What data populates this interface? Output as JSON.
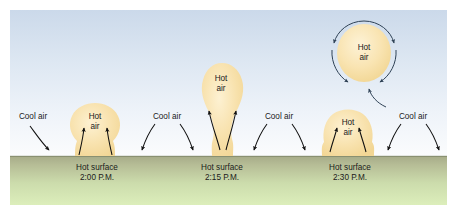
{
  "figure": {
    "colors": {
      "sky_top": "#cfdcec",
      "sky_bottom": "#fbfcfd",
      "ground_top": "#a8ad8c",
      "ground_bottom": "#d9e8b8",
      "plume_fill": "#f6dda2",
      "plume_fill_light": "#fbeec6",
      "arrow": "#101010",
      "circulation_arrow": "#3a4a5a",
      "text": "#1a1a1a",
      "page_background": "#ffffff"
    }
  },
  "labels": {
    "cool_air": "Cool air",
    "hot_word": "Hot",
    "air_word": "air",
    "hot_surface": "Hot surface"
  },
  "cool_air_labels": [
    {
      "id": "cool-air-1",
      "text": "Cool air",
      "x": 33,
      "y": 117
    },
    {
      "id": "cool-air-2",
      "text": "Cool air",
      "x": 167,
      "y": 117
    },
    {
      "id": "cool-air-3",
      "text": "Cool air",
      "x": 279,
      "y": 117
    },
    {
      "id": "cool-air-4",
      "text": "Cool air",
      "x": 413,
      "y": 117
    }
  ],
  "stages": [
    {
      "id": "stage-1",
      "time": "2:00 P.M.",
      "surface_label": "Hot surface",
      "hot_label_line1": "Hot",
      "hot_label_line2": "air",
      "caption_x": 97,
      "caption_y1": 168,
      "caption_y2": 178,
      "hot_x": 95,
      "hot_y1": 117,
      "hot_y2": 127
    },
    {
      "id": "stage-2",
      "time": "2:15 P.M.",
      "surface_label": "Hot surface",
      "hot_label_line1": "Hot",
      "hot_label_line2": "air",
      "caption_x": 222,
      "caption_y1": 168,
      "caption_y2": 178,
      "hot_x": 221,
      "hot_y1": 79,
      "hot_y2": 89
    },
    {
      "id": "stage-3",
      "time": "2:30 P.M.",
      "surface_label": "Hot surface",
      "hot_label_line1": "Hot",
      "hot_label_line2": "air",
      "caption_x": 350,
      "caption_y1": 168,
      "caption_y2": 178,
      "hot_x": 348,
      "hot_y1": 123,
      "hot_y2": 133
    }
  ],
  "detached_blob": {
    "id": "detached-hot-air",
    "hot_label_line1": "Hot",
    "hot_label_line2": "air",
    "hot_x": 364,
    "hot_y1": 48,
    "hot_y2": 58
  }
}
